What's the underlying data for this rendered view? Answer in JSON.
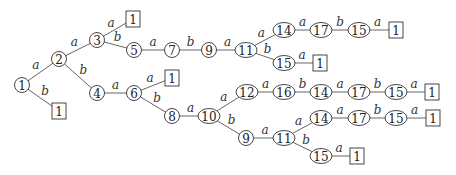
{
  "diagram": {
    "type": "tree",
    "nodes": [
      {
        "id": "n1",
        "label": "1",
        "shape": "circle"
      },
      {
        "id": "n2",
        "label": "2",
        "shape": "circle"
      },
      {
        "id": "l1",
        "label": "1",
        "shape": "box"
      },
      {
        "id": "n3",
        "label": "3",
        "shape": "circle"
      },
      {
        "id": "n4",
        "label": "4",
        "shape": "circle"
      },
      {
        "id": "l2",
        "label": "1",
        "shape": "box"
      },
      {
        "id": "n5",
        "label": "5",
        "shape": "circle"
      },
      {
        "id": "n7",
        "label": "7",
        "shape": "circle"
      },
      {
        "id": "n9",
        "label": "9",
        "shape": "circle"
      },
      {
        "id": "n11",
        "label": "11",
        "shape": "circle"
      },
      {
        "id": "n14",
        "label": "14",
        "shape": "circle"
      },
      {
        "id": "n17",
        "label": "17",
        "shape": "circle"
      },
      {
        "id": "n15",
        "label": "15",
        "shape": "circle"
      },
      {
        "id": "l3",
        "label": "1",
        "shape": "box"
      },
      {
        "id": "n15b",
        "label": "15",
        "shape": "circle"
      },
      {
        "id": "l4",
        "label": "1",
        "shape": "box"
      },
      {
        "id": "n6",
        "label": "6",
        "shape": "circle"
      },
      {
        "id": "l5",
        "label": "1",
        "shape": "box"
      },
      {
        "id": "n8",
        "label": "8",
        "shape": "circle"
      },
      {
        "id": "n10",
        "label": "10",
        "shape": "circle"
      },
      {
        "id": "n12",
        "label": "12",
        "shape": "circle"
      },
      {
        "id": "n16",
        "label": "16",
        "shape": "circle"
      },
      {
        "id": "n14c",
        "label": "14",
        "shape": "circle"
      },
      {
        "id": "n17c",
        "label": "17",
        "shape": "circle"
      },
      {
        "id": "n15c",
        "label": "15",
        "shape": "circle"
      },
      {
        "id": "l6",
        "label": "1",
        "shape": "box"
      },
      {
        "id": "n9d",
        "label": "9",
        "shape": "circle"
      },
      {
        "id": "n11d",
        "label": "11",
        "shape": "circle"
      },
      {
        "id": "n14d",
        "label": "14",
        "shape": "circle"
      },
      {
        "id": "n17d",
        "label": "17",
        "shape": "circle"
      },
      {
        "id": "n15d",
        "label": "15",
        "shape": "circle"
      },
      {
        "id": "l7",
        "label": "1",
        "shape": "box"
      },
      {
        "id": "n15e",
        "label": "15",
        "shape": "circle"
      },
      {
        "id": "l8",
        "label": "1",
        "shape": "box"
      }
    ],
    "edges": [
      {
        "from": "n1",
        "to": "n2",
        "label": "a"
      },
      {
        "from": "n1",
        "to": "l1",
        "label": "b"
      },
      {
        "from": "n2",
        "to": "n3",
        "label": "a"
      },
      {
        "from": "n2",
        "to": "n4",
        "label": "b"
      },
      {
        "from": "n3",
        "to": "l2",
        "label": "a"
      },
      {
        "from": "n3",
        "to": "n5",
        "label": "b"
      },
      {
        "from": "n5",
        "to": "n7",
        "label": "a"
      },
      {
        "from": "n7",
        "to": "n9",
        "label": "b"
      },
      {
        "from": "n9",
        "to": "n11",
        "label": "a"
      },
      {
        "from": "n11",
        "to": "n14",
        "label": "a"
      },
      {
        "from": "n14",
        "to": "n17",
        "label": "a"
      },
      {
        "from": "n17",
        "to": "n15",
        "label": "b"
      },
      {
        "from": "n15",
        "to": "l3",
        "label": "a"
      },
      {
        "from": "n11",
        "to": "n15b",
        "label": "b"
      },
      {
        "from": "n15b",
        "to": "l4",
        "label": "a"
      },
      {
        "from": "n4",
        "to": "n6",
        "label": "a"
      },
      {
        "from": "n6",
        "to": "l5",
        "label": "a"
      },
      {
        "from": "n6",
        "to": "n8",
        "label": "b"
      },
      {
        "from": "n8",
        "to": "n10",
        "label": "a"
      },
      {
        "from": "n10",
        "to": "n12",
        "label": "a"
      },
      {
        "from": "n12",
        "to": "n16",
        "label": "a"
      },
      {
        "from": "n16",
        "to": "n14c",
        "label": "b"
      },
      {
        "from": "n14c",
        "to": "n17c",
        "label": "a"
      },
      {
        "from": "n17c",
        "to": "n15c",
        "label": "b"
      },
      {
        "from": "n15c",
        "to": "l6",
        "label": "a"
      },
      {
        "from": "n10",
        "to": "n9d",
        "label": "b"
      },
      {
        "from": "n9d",
        "to": "n11d",
        "label": "a"
      },
      {
        "from": "n11d",
        "to": "n14d",
        "label": "a"
      },
      {
        "from": "n14d",
        "to": "n17d",
        "label": "a"
      },
      {
        "from": "n17d",
        "to": "n15d",
        "label": "b"
      },
      {
        "from": "n15d",
        "to": "l7",
        "label": "a"
      },
      {
        "from": "n11d",
        "to": "n15e",
        "label": "b"
      },
      {
        "from": "n15e",
        "to": "l8",
        "label": "a"
      }
    ]
  }
}
